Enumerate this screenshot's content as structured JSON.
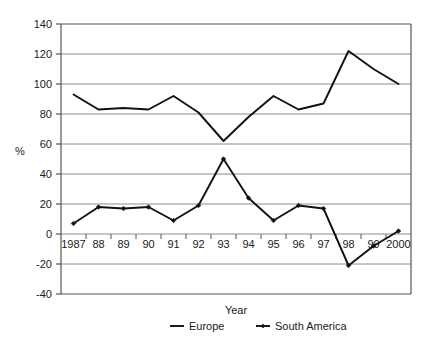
{
  "chart_data": {
    "type": "line",
    "title": "",
    "xlabel": "Year",
    "ylabel": "%",
    "xlim": [
      1986.5,
      2000.5
    ],
    "ylim": [
      -40,
      140
    ],
    "ytick_step": 20,
    "grid": true,
    "legend_position": "bottom",
    "categories": [
      "1987",
      "88",
      "89",
      "90",
      "91",
      "92",
      "93",
      "94",
      "95",
      "96",
      "97",
      "98",
      "99",
      "2000"
    ],
    "yticks": [
      "140",
      "120",
      "100",
      "80",
      "60",
      "40",
      "20",
      "0",
      "-20",
      "-40"
    ],
    "ytick_values": [
      140,
      120,
      100,
      80,
      60,
      40,
      20,
      0,
      -20,
      -40
    ],
    "series": [
      {
        "name": "Europe",
        "marker": "none",
        "color": "#111111",
        "values": [
          93,
          83,
          84,
          83,
          92,
          81,
          62,
          78,
          92,
          83,
          87,
          122,
          110,
          100
        ]
      },
      {
        "name": "South America",
        "marker": "diamond",
        "color": "#111111",
        "values": [
          7,
          18,
          17,
          18,
          9,
          19,
          50,
          24,
          9,
          19,
          17,
          -21,
          -8,
          2
        ]
      }
    ]
  },
  "legend": {
    "items": [
      {
        "label": "Europe",
        "marker": "line"
      },
      {
        "label": "South America",
        "marker": "line-with-marker"
      }
    ]
  },
  "axes": {
    "x_title": "Year",
    "y_title": "%"
  },
  "style": {
    "grid_color": "#8c8c8c",
    "frame_color": "#555555",
    "series_color": "#111111",
    "background": "#ffffff"
  }
}
